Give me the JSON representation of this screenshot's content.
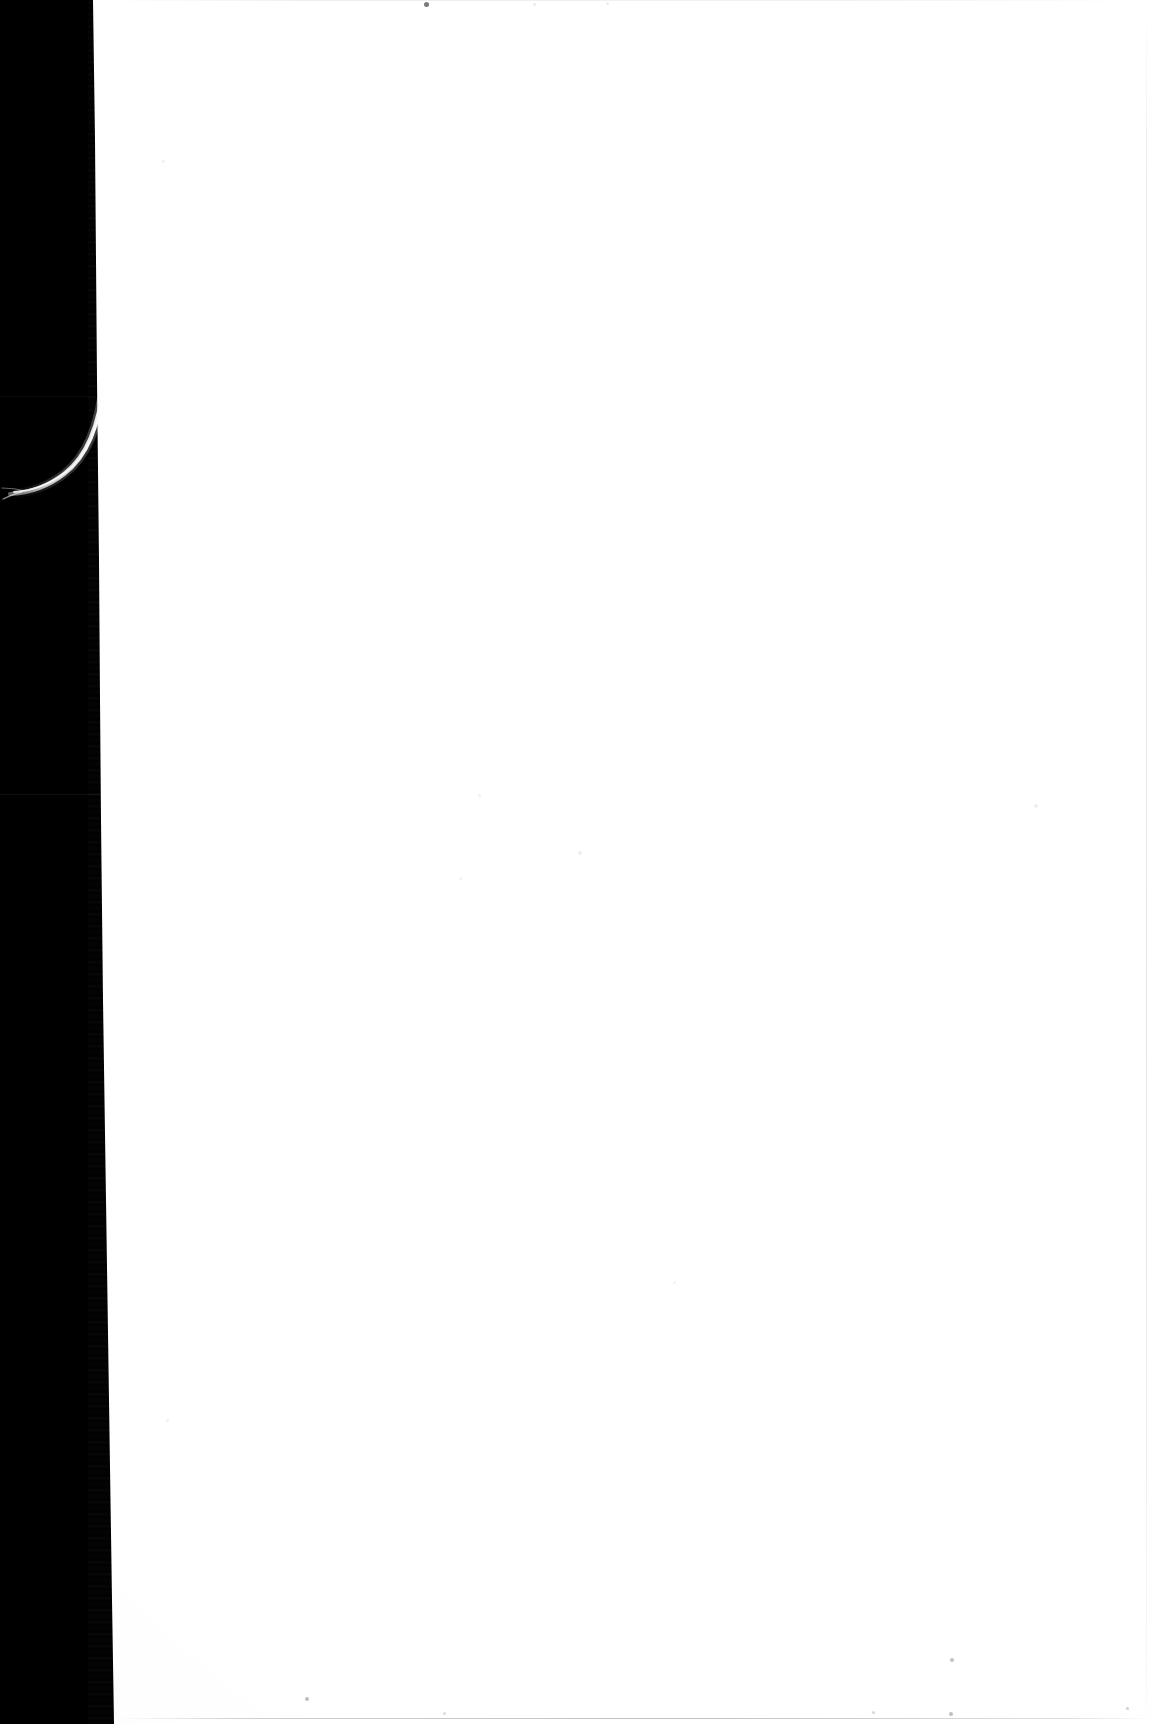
{
  "document": {
    "kind": "scanned-page-image",
    "page_side": "verso",
    "content_text": "",
    "has_printed_text": false,
    "has_handwriting": false,
    "has_illustration": false,
    "page_width_px": 1152,
    "page_height_px": 1724
  },
  "colors": {
    "scanner_bed": "#000000",
    "paper_white": "#ffffff",
    "paper_offwhite": "#fdfdfd",
    "paper_shadow_edge": "#f8f8f9",
    "edge_rule_gray": "#8d8d93",
    "fiber_white": "#f2f2f2"
  },
  "regions": {
    "scanner_bed": {
      "name": "scanner-bed-border",
      "x": 0,
      "y": 0,
      "width": 95,
      "height": 1724,
      "description": "black scanner bed visible to the left of the sheet"
    },
    "paper_sheet": {
      "name": "paper-sheet",
      "x": 95,
      "y": 0,
      "width": 1057,
      "height": 1724,
      "description": "blank scanned leaf, left cut edge slants right toward the foot"
    }
  },
  "artifacts": {
    "fiber": {
      "name": "fiber-thread-artifact",
      "description": "pale curving fibre lifting off the sheet edge into the dark bed",
      "x": 0,
      "y": 360,
      "width": 140,
      "height": 170
    },
    "bed_seams": [
      {
        "name": "bed-seam-upper",
        "x": 0,
        "y": 396,
        "width": 96,
        "height": 1
      },
      {
        "name": "bed-seam-lower",
        "x": 0,
        "y": 794,
        "width": 118,
        "height": 1
      }
    ],
    "edge_rules": [
      {
        "name": "edge-rule-top",
        "x": 100,
        "y": 0,
        "width": 1052,
        "height": 1
      },
      {
        "name": "edge-rule-right",
        "x": 1146,
        "y": 0,
        "width": 1,
        "height": 1724
      },
      {
        "name": "edge-rule-bottom",
        "x": 116,
        "y": 1718,
        "width": 1036,
        "height": 1
      }
    ],
    "specks": [
      {
        "name": "speck-top-dark",
        "x": 424,
        "y": 2,
        "size": 5,
        "opacity": 0.62
      },
      {
        "name": "speck-top-faint-a",
        "x": 533,
        "y": 3,
        "size": 3,
        "opacity": 0.1
      },
      {
        "name": "speck-top-faint-b",
        "x": 606,
        "y": 2,
        "size": 3,
        "opacity": 0.09
      },
      {
        "name": "speck-upper-left",
        "x": 162,
        "y": 160,
        "size": 3,
        "opacity": 0.07
      },
      {
        "name": "speck-mid-a",
        "x": 478,
        "y": 794,
        "size": 3,
        "opacity": 0.07
      },
      {
        "name": "speck-mid-b",
        "x": 578,
        "y": 851,
        "size": 4,
        "opacity": 0.08
      },
      {
        "name": "speck-mid-c",
        "x": 459,
        "y": 877,
        "size": 3,
        "opacity": 0.06
      },
      {
        "name": "speck-right-mid",
        "x": 1034,
        "y": 804,
        "size": 4,
        "opacity": 0.08
      },
      {
        "name": "speck-lower-left",
        "x": 166,
        "y": 1419,
        "size": 3,
        "opacity": 0.07
      },
      {
        "name": "speck-lower-mid",
        "x": 673,
        "y": 1281,
        "size": 3,
        "opacity": 0.06
      },
      {
        "name": "speck-foot-a",
        "x": 305,
        "y": 1697,
        "size": 4,
        "opacity": 0.3
      },
      {
        "name": "speck-foot-b",
        "x": 950,
        "y": 1658,
        "size": 4,
        "opacity": 0.28
      },
      {
        "name": "speck-foot-c",
        "x": 949,
        "y": 1712,
        "size": 4,
        "opacity": 0.3
      },
      {
        "name": "speck-foot-d",
        "x": 1126,
        "y": 1707,
        "size": 3,
        "opacity": 0.22
      },
      {
        "name": "speck-foot-e",
        "x": 872,
        "y": 1711,
        "size": 3,
        "opacity": 0.18
      },
      {
        "name": "speck-foot-f",
        "x": 443,
        "y": 1712,
        "size": 3,
        "opacity": 0.16
      }
    ]
  }
}
